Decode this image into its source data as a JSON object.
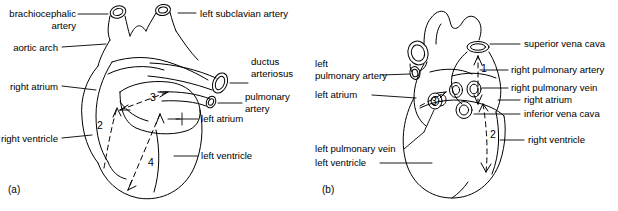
{
  "figure": {
    "background_color": "#ffffff",
    "line_color": "#000000",
    "text_color": "#000000"
  },
  "panels": [
    {
      "id": "a",
      "caption": "(a)",
      "labels_left": [
        {
          "name": "brachiocephalic-artery",
          "text": "brachiocephalic\nartery"
        },
        {
          "name": "aortic-arch",
          "text": "aortic arch"
        },
        {
          "name": "right-atrium",
          "text": "right atrium"
        },
        {
          "name": "right-ventricle",
          "text": "right ventricle"
        }
      ],
      "labels_right": [
        {
          "name": "left-subclavian-artery",
          "text": "left subclavian artery"
        },
        {
          "name": "ductus-arteriosus",
          "text": "ductus\narteriosus"
        },
        {
          "name": "pulmonary-artery",
          "text": "pulmonary\nartery"
        },
        {
          "name": "left-atrium",
          "text": "left atrium"
        },
        {
          "name": "left-ventricle",
          "text": "left ventricle"
        }
      ],
      "flow_markers": [
        {
          "name": "flow-marker-2",
          "text": "2"
        },
        {
          "name": "flow-marker-3",
          "text": "3"
        },
        {
          "name": "flow-marker-4",
          "text": "4"
        }
      ]
    },
    {
      "id": "b",
      "caption": "(b)",
      "labels_left": [
        {
          "name": "left-pulmonary-artery",
          "text": "left\npulmonary artery"
        },
        {
          "name": "left-atrium",
          "text": "left atrium"
        },
        {
          "name": "left-pulmonary-vein",
          "text": "left pulmonary vein"
        },
        {
          "name": "left-ventricle",
          "text": "left ventricle"
        }
      ],
      "labels_right": [
        {
          "name": "superior-vena-cava",
          "text": "superior vena cava"
        },
        {
          "name": "right-pulmonary-artery",
          "text": "right pulmonary artery"
        },
        {
          "name": "right-pulmonary-vein",
          "text": "right pulmonary vein"
        },
        {
          "name": "right-atrium",
          "text": "right atrium"
        },
        {
          "name": "inferior-vena-cava",
          "text": "inferior vena cava"
        },
        {
          "name": "right-ventricle",
          "text": "right ventricle"
        }
      ],
      "flow_markers": [
        {
          "name": "flow-marker-1",
          "text": "1"
        },
        {
          "name": "flow-marker-2",
          "text": "2"
        },
        {
          "name": "flow-marker-3",
          "text": "3"
        }
      ]
    }
  ]
}
